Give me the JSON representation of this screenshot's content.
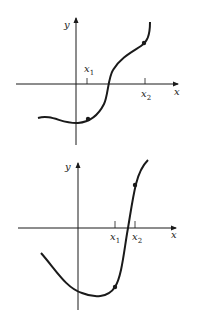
{
  "graphs": [
    {
      "id": "top",
      "x_axis_label": "x",
      "y_axis_label": "y",
      "ticks": [
        {
          "label": "x",
          "sub": "1",
          "position": "above"
        },
        {
          "label": "x",
          "sub": "2",
          "position": "below"
        }
      ],
      "marked_points": 2,
      "description": "Increasing curve with inflection; points marked at x1 (below axis) and x2 (above axis)"
    },
    {
      "id": "bottom",
      "x_axis_label": "x",
      "y_axis_label": "y",
      "ticks": [
        {
          "label": "x",
          "sub": "1",
          "position": "below"
        },
        {
          "label": "x",
          "sub": "2",
          "position": "below"
        }
      ],
      "marked_points": 2,
      "description": "Curve dips to a minimum then rises steeply; points marked at x1 (below axis) and x2 (above axis)"
    }
  ],
  "colors": {
    "stroke": "#1a1a1a",
    "background": "#ffffff"
  }
}
